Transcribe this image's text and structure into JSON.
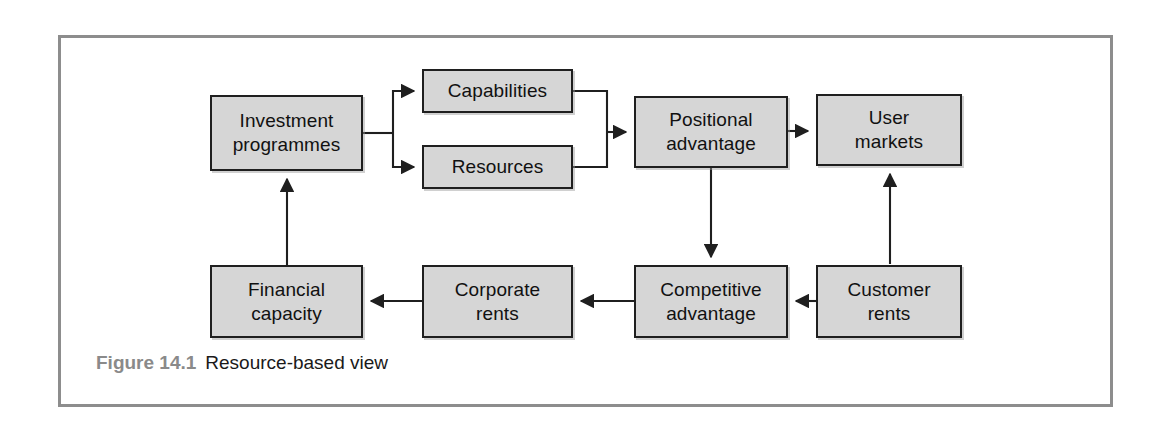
{
  "figure": {
    "caption_label": "Figure 14.1",
    "caption_title": "Resource-based view",
    "frame_color": "#8d8d8d",
    "node_fill": "#d6d6d6",
    "node_border": "#1f1f1f",
    "connector_color": "#1f1f1f",
    "label_color": "#8a8a8a"
  },
  "diagram": {
    "type": "flow-diagram",
    "nodes": [
      {
        "id": "investment-programmes",
        "label": "Investment\nprogrammes",
        "x": 210,
        "y": 95,
        "w": 153,
        "h": 76
      },
      {
        "id": "capabilities",
        "label": "Capabilities",
        "x": 422,
        "y": 69,
        "w": 151,
        "h": 44
      },
      {
        "id": "resources",
        "label": "Resources",
        "x": 422,
        "y": 145,
        "w": 151,
        "h": 44
      },
      {
        "id": "positional-advantage",
        "label": "Positional\nadvantage",
        "x": 634,
        "y": 96,
        "w": 154,
        "h": 72
      },
      {
        "id": "user-markets",
        "label": "User\nmarkets",
        "x": 816,
        "y": 94,
        "w": 146,
        "h": 72
      },
      {
        "id": "financial-capacity",
        "label": "Financial\ncapacity",
        "x": 210,
        "y": 265,
        "w": 153,
        "h": 73
      },
      {
        "id": "corporate-rents",
        "label": "Corporate\nrents",
        "x": 422,
        "y": 265,
        "w": 151,
        "h": 73
      },
      {
        "id": "competitive-advantage",
        "label": "Competitive\nadvantage",
        "x": 634,
        "y": 265,
        "w": 154,
        "h": 73
      },
      {
        "id": "customer-rents",
        "label": "Customer\nrents",
        "x": 816,
        "y": 265,
        "w": 146,
        "h": 73
      }
    ],
    "edges": [
      {
        "from": "investment-programmes",
        "to": "capabilities",
        "style": "elbow-fork"
      },
      {
        "from": "investment-programmes",
        "to": "resources",
        "style": "elbow-fork"
      },
      {
        "from": "capabilities",
        "to": "positional-advantage",
        "style": "elbow-merge"
      },
      {
        "from": "resources",
        "to": "positional-advantage",
        "style": "elbow-merge"
      },
      {
        "from": "positional-advantage",
        "to": "user-markets",
        "style": "straight-right"
      },
      {
        "from": "positional-advantage",
        "to": "competitive-advantage",
        "style": "straight-down"
      },
      {
        "from": "customer-rents",
        "to": "user-markets",
        "style": "straight-up"
      },
      {
        "from": "customer-rents",
        "to": "competitive-advantage",
        "style": "straight-left"
      },
      {
        "from": "competitive-advantage",
        "to": "corporate-rents",
        "style": "straight-left"
      },
      {
        "from": "corporate-rents",
        "to": "financial-capacity",
        "style": "straight-left"
      },
      {
        "from": "financial-capacity",
        "to": "investment-programmes",
        "style": "straight-up"
      }
    ]
  }
}
